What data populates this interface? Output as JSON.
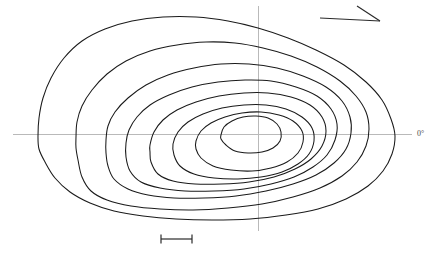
{
  "figure": {
    "type": "contour-polar-plot",
    "background_color": "#ffffff",
    "contour_color": "#1a1a1a",
    "axis_color": "#b9b9b9",
    "label_color": "#4a4a4a",
    "width": 439,
    "height": 258
  },
  "labels": {
    "zero_degree": "0°",
    "partial_caption": ""
  },
  "axes": {
    "horizontal": {
      "y": 134,
      "x_start": 13,
      "x_end": 412
    },
    "vertical": {
      "x": 258,
      "y_start": 6,
      "y_end": 231
    },
    "origin": {
      "x": 258,
      "y": 134
    }
  },
  "annotations": {
    "direction_arrow": {
      "name": "direction-arrow",
      "shaft_start": {
        "x": 320,
        "y": 18
      },
      "shaft_end": {
        "x": 380,
        "y": 21
      },
      "barb_start": {
        "x": 357,
        "y": 6
      },
      "barb_end": {
        "x": 380,
        "y": 21
      }
    },
    "scale_bar": {
      "name": "scale-bar",
      "x_start": 161,
      "x_end": 192,
      "y": 239,
      "tick_height": 9,
      "label": ""
    }
  },
  "chart_data": {
    "type": "line",
    "title": "",
    "subtitle": "",
    "xlabel": "",
    "ylabel": "",
    "grid": false,
    "legend_position": "none",
    "axis_tick_labels": [
      "0°"
    ],
    "annotations": [
      "direction arrow (upper right)",
      "scale bar (lower centre-left)"
    ],
    "series": [
      {
        "name": "contour-1-outermost",
        "level": 1,
        "closed": true,
        "points": [
          [
            38,
            136
          ],
          [
            39,
            118
          ],
          [
            43,
            98
          ],
          [
            51,
            78
          ],
          [
            64,
            58
          ],
          [
            82,
            41
          ],
          [
            105,
            29
          ],
          [
            132,
            21
          ],
          [
            163,
            17
          ],
          [
            196,
            17
          ],
          [
            228,
            21
          ],
          [
            258,
            28
          ],
          [
            288,
            38
          ],
          [
            316,
            50
          ],
          [
            344,
            65
          ],
          [
            366,
            82
          ],
          [
            382,
            100
          ],
          [
            391,
            119
          ],
          [
            395,
            136
          ],
          [
            392,
            154
          ],
          [
            383,
            171
          ],
          [
            368,
            186
          ],
          [
            346,
            199
          ],
          [
            318,
            209
          ],
          [
            286,
            215
          ],
          [
            250,
            219
          ],
          [
            212,
            220
          ],
          [
            176,
            219
          ],
          [
            143,
            216
          ],
          [
            114,
            211
          ],
          [
            90,
            203
          ],
          [
            70,
            192
          ],
          [
            55,
            178
          ],
          [
            45,
            162
          ],
          [
            39,
            149
          ],
          [
            38,
            136
          ]
        ]
      },
      {
        "name": "contour-2",
        "level": 2,
        "closed": true,
        "points": [
          [
            76,
            137
          ],
          [
            77,
            122
          ],
          [
            82,
            106
          ],
          [
            92,
            90
          ],
          [
            107,
            74
          ],
          [
            126,
            61
          ],
          [
            150,
            51
          ],
          [
            177,
            45
          ],
          [
            206,
            42
          ],
          [
            235,
            43
          ],
          [
            263,
            48
          ],
          [
            291,
            56
          ],
          [
            317,
            67
          ],
          [
            340,
            81
          ],
          [
            356,
            96
          ],
          [
            366,
            112
          ],
          [
            369,
            129
          ],
          [
            366,
            146
          ],
          [
            357,
            162
          ],
          [
            342,
            176
          ],
          [
            320,
            188
          ],
          [
            293,
            197
          ],
          [
            262,
            204
          ],
          [
            228,
            208
          ],
          [
            193,
            210
          ],
          [
            160,
            209
          ],
          [
            131,
            206
          ],
          [
            107,
            200
          ],
          [
            91,
            191
          ],
          [
            82,
            177
          ],
          [
            78,
            160
          ],
          [
            76,
            148
          ],
          [
            76,
            137
          ]
        ]
      },
      {
        "name": "contour-3",
        "level": 3,
        "closed": true,
        "points": [
          [
            106,
            140
          ],
          [
            108,
            126
          ],
          [
            115,
            112
          ],
          [
            128,
            98
          ],
          [
            146,
            85
          ],
          [
            168,
            75
          ],
          [
            194,
            68
          ],
          [
            221,
            64
          ],
          [
            249,
            64
          ],
          [
            277,
            68
          ],
          [
            303,
            76
          ],
          [
            326,
            87
          ],
          [
            342,
            101
          ],
          [
            350,
            117
          ],
          [
            351,
            133
          ],
          [
            346,
            149
          ],
          [
            334,
            163
          ],
          [
            316,
            175
          ],
          [
            293,
            184
          ],
          [
            266,
            191
          ],
          [
            236,
            196
          ],
          [
            204,
            198
          ],
          [
            174,
            198
          ],
          [
            148,
            195
          ],
          [
            128,
            189
          ],
          [
            114,
            179
          ],
          [
            108,
            166
          ],
          [
            106,
            153
          ],
          [
            106,
            140
          ]
        ]
      },
      {
        "name": "contour-4",
        "level": 4,
        "closed": true,
        "points": [
          [
            126,
            143
          ],
          [
            129,
            130
          ],
          [
            137,
            117
          ],
          [
            150,
            105
          ],
          [
            169,
            95
          ],
          [
            192,
            87
          ],
          [
            218,
            82
          ],
          [
            245,
            80
          ],
          [
            271,
            81
          ],
          [
            296,
            87
          ],
          [
            317,
            96
          ],
          [
            331,
            109
          ],
          [
            337,
            124
          ],
          [
            335,
            140
          ],
          [
            327,
            155
          ],
          [
            313,
            167
          ],
          [
            294,
            177
          ],
          [
            271,
            184
          ],
          [
            244,
            189
          ],
          [
            214,
            191
          ],
          [
            185,
            191
          ],
          [
            160,
            188
          ],
          [
            141,
            182
          ],
          [
            130,
            171
          ],
          [
            126,
            157
          ],
          [
            126,
            143
          ]
        ]
      },
      {
        "name": "contour-5",
        "level": 5,
        "closed": true,
        "points": [
          [
            150,
            145
          ],
          [
            154,
            132
          ],
          [
            163,
            120
          ],
          [
            177,
            110
          ],
          [
            196,
            102
          ],
          [
            219,
            96
          ],
          [
            244,
            93
          ],
          [
            268,
            93
          ],
          [
            291,
            97
          ],
          [
            310,
            105
          ],
          [
            322,
            117
          ],
          [
            326,
            131
          ],
          [
            322,
            146
          ],
          [
            311,
            159
          ],
          [
            295,
            169
          ],
          [
            274,
            177
          ],
          [
            249,
            182
          ],
          [
            222,
            184
          ],
          [
            195,
            184
          ],
          [
            173,
            181
          ],
          [
            158,
            174
          ],
          [
            151,
            162
          ],
          [
            150,
            152
          ],
          [
            150,
            145
          ]
        ]
      },
      {
        "name": "contour-6",
        "level": 6,
        "closed": true,
        "points": [
          [
            173,
            144
          ],
          [
            178,
            132
          ],
          [
            188,
            122
          ],
          [
            203,
            114
          ],
          [
            222,
            108
          ],
          [
            244,
            105
          ],
          [
            266,
            105
          ],
          [
            286,
            109
          ],
          [
            302,
            117
          ],
          [
            312,
            128
          ],
          [
            314,
            141
          ],
          [
            309,
            154
          ],
          [
            298,
            164
          ],
          [
            282,
            172
          ],
          [
            261,
            177
          ],
          [
            238,
            179
          ],
          [
            214,
            178
          ],
          [
            194,
            174
          ],
          [
            180,
            166
          ],
          [
            174,
            155
          ],
          [
            173,
            144
          ]
        ]
      },
      {
        "name": "contour-7",
        "level": 7,
        "closed": true,
        "points": [
          [
            196,
            141
          ],
          [
            201,
            131
          ],
          [
            211,
            123
          ],
          [
            225,
            117
          ],
          [
            242,
            113
          ],
          [
            261,
            112
          ],
          [
            279,
            115
          ],
          [
            293,
            121
          ],
          [
            302,
            131
          ],
          [
            303,
            142
          ],
          [
            298,
            153
          ],
          [
            287,
            162
          ],
          [
            271,
            168
          ],
          [
            252,
            171
          ],
          [
            231,
            170
          ],
          [
            213,
            166
          ],
          [
            201,
            158
          ],
          [
            196,
            149
          ],
          [
            196,
            141
          ]
        ]
      },
      {
        "name": "contour-8-innermost",
        "level": 8,
        "closed": true,
        "points": [
          [
            221,
            135
          ],
          [
            224,
            127
          ],
          [
            232,
            121
          ],
          [
            243,
            117
          ],
          [
            256,
            116
          ],
          [
            268,
            118
          ],
          [
            277,
            124
          ],
          [
            281,
            132
          ],
          [
            280,
            141
          ],
          [
            273,
            148
          ],
          [
            262,
            152
          ],
          [
            248,
            153
          ],
          [
            235,
            151
          ],
          [
            226,
            145
          ],
          [
            221,
            139
          ],
          [
            221,
            135
          ]
        ]
      }
    ]
  }
}
